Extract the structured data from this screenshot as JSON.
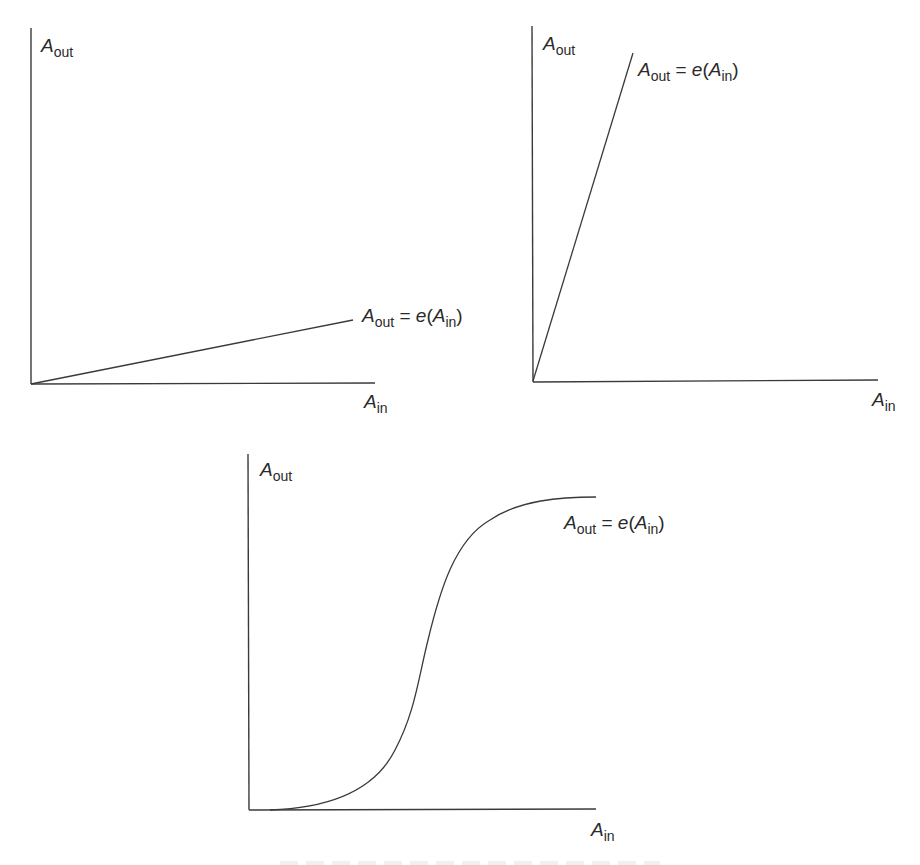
{
  "panels": [
    {
      "id": "linear-low-gain",
      "y_label": {
        "base": "A",
        "sub": "out"
      },
      "x_label": {
        "base": "A",
        "sub": "in"
      },
      "curve_label": {
        "lhs_base": "A",
        "lhs_sub": "out",
        "eq": " = ",
        "fn": "e",
        "open": "(",
        "arg_base": "A",
        "arg_sub": "in",
        "close": ")"
      },
      "shape": "linear, shallow slope"
    },
    {
      "id": "linear-high-gain",
      "y_label": {
        "base": "A",
        "sub": "out"
      },
      "x_label": {
        "base": "A",
        "sub": "in"
      },
      "curve_label": {
        "lhs_base": "A",
        "lhs_sub": "out",
        "eq": " = ",
        "fn": "e",
        "open": "(",
        "arg_base": "A",
        "arg_sub": "in",
        "close": ")"
      },
      "shape": "linear, steep slope"
    },
    {
      "id": "sigmoid",
      "y_label": {
        "base": "A",
        "sub": "out"
      },
      "x_label": {
        "base": "A",
        "sub": "in"
      },
      "curve_label": {
        "lhs_base": "A",
        "lhs_sub": "out",
        "eq": " = ",
        "fn": "e",
        "open": "(",
        "arg_base": "A",
        "arg_sub": "in",
        "close": ")"
      },
      "shape": "sigmoid (S-shaped saturating)"
    }
  ]
}
